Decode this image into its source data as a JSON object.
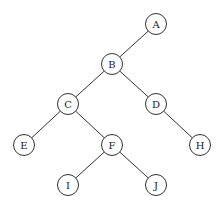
{
  "tree": {
    "nodes": [
      {
        "id": "A",
        "label": "A",
        "x": 156,
        "y": 24
      },
      {
        "id": "B",
        "label": "B",
        "x": 112,
        "y": 64
      },
      {
        "id": "C",
        "label": "C",
        "x": 68,
        "y": 104
      },
      {
        "id": "D",
        "label": "D",
        "x": 156,
        "y": 104
      },
      {
        "id": "E",
        "label": "E",
        "x": 24,
        "y": 145
      },
      {
        "id": "F",
        "label": "F",
        "x": 112,
        "y": 145
      },
      {
        "id": "H",
        "label": "H",
        "x": 200,
        "y": 145
      },
      {
        "id": "I",
        "label": "I",
        "x": 68,
        "y": 185
      },
      {
        "id": "J",
        "label": "J",
        "x": 156,
        "y": 185
      }
    ],
    "edges": [
      [
        "A",
        "B"
      ],
      [
        "B",
        "C"
      ],
      [
        "B",
        "D"
      ],
      [
        "C",
        "E"
      ],
      [
        "C",
        "F"
      ],
      [
        "D",
        "H"
      ],
      [
        "F",
        "I"
      ],
      [
        "F",
        "J"
      ]
    ],
    "radius": 10.5
  }
}
